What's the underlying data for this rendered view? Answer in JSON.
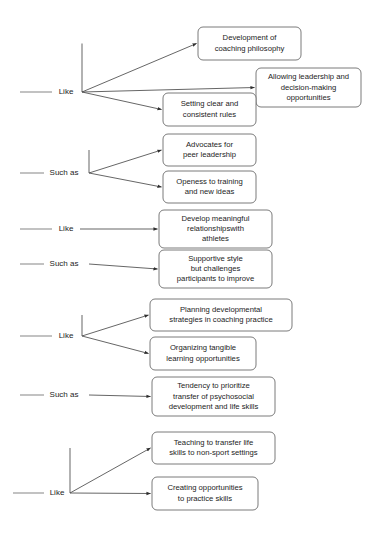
{
  "diagram": {
    "type": "flow-tree",
    "background": "#ffffff",
    "box_stroke": "#6c6c6c",
    "line_stroke": "#4a4a4a",
    "text_color": "#1c1c1c",
    "groups": [
      {
        "id": "group-1",
        "relation_label": "Like",
        "label_x": 66,
        "label_y": 92,
        "stub_x1": 20,
        "stub_x2": 52,
        "branch_x": 82,
        "branch_y": 92,
        "targets": [
          {
            "id": "node-development-of-coaching-philosophy",
            "lines": [
              "Development of",
              "coaching philosophy"
            ],
            "x": 198,
            "y": 27,
            "w": 103,
            "h": 33
          },
          {
            "id": "node-allowing-leadership",
            "lines": [
              "Allowing leadership and",
              "decision-making",
              "opportunities"
            ],
            "x": 256,
            "y": 68,
            "w": 105,
            "h": 39
          },
          {
            "id": "node-setting-clear-rules",
            "lines": [
              "Setting clear and",
              "consistent rules"
            ],
            "x": 163,
            "y": 93,
            "w": 93,
            "h": 33
          }
        ]
      },
      {
        "id": "group-2",
        "relation_label": "Such as",
        "label_x": 64,
        "label_y": 173,
        "stub_x1": 20,
        "stub_x2": 44,
        "branch_x": 89,
        "branch_y": 173,
        "targets": [
          {
            "id": "node-advocates-peer-leadership",
            "lines": [
              "Advocates for",
              "peer leadership"
            ],
            "x": 163,
            "y": 134,
            "w": 93,
            "h": 32
          },
          {
            "id": "node-openess-to-training",
            "lines": [
              "Openess to training",
              "and new ideas"
            ],
            "x": 163,
            "y": 171,
            "w": 93,
            "h": 32
          }
        ]
      },
      {
        "id": "group-3",
        "relation_label": "Like",
        "label_x": 66,
        "label_y": 229,
        "stub_x1": 20,
        "stub_x2": 52,
        "branch_x": 80,
        "branch_y": 229,
        "targets": [
          {
            "id": "node-develop-meaningful-relationships",
            "lines": [
              "Develop meaningful",
              "relationshipswith",
              "athletes"
            ],
            "x": 159,
            "y": 210,
            "w": 113,
            "h": 38
          }
        ]
      },
      {
        "id": "group-4",
        "relation_label": "Such as",
        "label_x": 64,
        "label_y": 264,
        "stub_x1": 20,
        "stub_x2": 44,
        "branch_x": 89,
        "branch_y": 264,
        "targets": [
          {
            "id": "node-supportive-style",
            "lines": [
              "Supportive style",
              "but challenges",
              "participants to improve"
            ],
            "x": 159,
            "y": 250,
            "w": 113,
            "h": 38
          }
        ]
      },
      {
        "id": "group-5",
        "relation_label": "Like",
        "label_x": 66,
        "label_y": 336,
        "stub_x1": 20,
        "stub_x2": 52,
        "branch_x": 82,
        "branch_y": 336,
        "targets": [
          {
            "id": "node-planning-developmental-strategies",
            "lines": [
              "Planning developmental",
              "strategies in coaching practice"
            ],
            "x": 150,
            "y": 299,
            "w": 142,
            "h": 32
          },
          {
            "id": "node-organizing-tangible-learning",
            "lines": [
              "Organizing tangible",
              "learning opportunities"
            ],
            "x": 150,
            "y": 337,
            "w": 106,
            "h": 33
          }
        ]
      },
      {
        "id": "group-6",
        "relation_label": "Such as",
        "label_x": 64,
        "label_y": 395,
        "stub_x1": 20,
        "stub_x2": 44,
        "branch_x": 89,
        "branch_y": 395,
        "targets": [
          {
            "id": "node-tendency-to-prioritize",
            "lines": [
              "Tendency to prioritize",
              "transfer of psychosocial",
              "development and life skills"
            ],
            "x": 152,
            "y": 377,
            "w": 123,
            "h": 39
          }
        ]
      },
      {
        "id": "group-7",
        "relation_label": "Like",
        "label_x": 57,
        "label_y": 493,
        "stub_x1": 13,
        "stub_x2": 44,
        "branch_x": 70,
        "branch_y": 493,
        "targets": [
          {
            "id": "node-teaching-to-transfer-life-skills",
            "lines": [
              "Teaching to transfer life",
              "skills to non-sport settings"
            ],
            "x": 152,
            "y": 432,
            "w": 123,
            "h": 32
          },
          {
            "id": "node-creating-opportunities",
            "lines": [
              "Creating opportunities",
              "to practice skills"
            ],
            "x": 152,
            "y": 477,
            "w": 106,
            "h": 33
          }
        ]
      }
    ]
  }
}
